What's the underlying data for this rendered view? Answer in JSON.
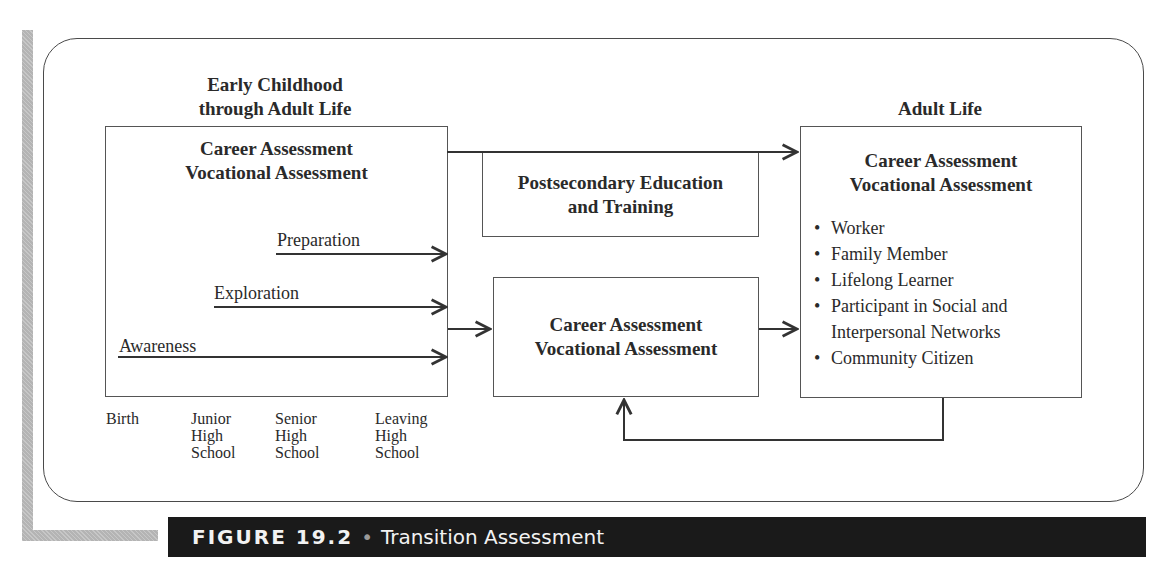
{
  "figure": {
    "number_label": "FIGURE 19.2",
    "separator": "•",
    "title": "Transition Assessment"
  },
  "left_column": {
    "heading_line1": "Early Childhood",
    "heading_line2": "through Adult Life",
    "box_title_line1": "Career Assessment",
    "box_title_line2": "Vocational Assessment",
    "stages": [
      {
        "label": "Preparation"
      },
      {
        "label": "Exploration"
      },
      {
        "label": "Awareness"
      }
    ],
    "timeline": [
      {
        "lines": [
          "Birth"
        ]
      },
      {
        "lines": [
          "Junior",
          "High",
          "School"
        ]
      },
      {
        "lines": [
          "Senior",
          "High",
          "School"
        ]
      },
      {
        "lines": [
          "Leaving",
          "High",
          "School"
        ]
      }
    ]
  },
  "postsecondary_box": {
    "line1": "Postsecondary Education",
    "line2": "and Training"
  },
  "middle_box": {
    "line1": "Career Assessment",
    "line2": "Vocational Assessment"
  },
  "right_column": {
    "heading": "Adult Life",
    "box_title_line1": "Career Assessment",
    "box_title_line2": "Vocational Assessment",
    "roles": [
      "Worker",
      "Family Member",
      "Lifelong Learner",
      "Participant in Social and Interpersonal Networks",
      "Community Citizen"
    ]
  },
  "colors": {
    "line": "#333333",
    "caption_bg": "#1a1a1a",
    "caption_text": "#f2f2f2",
    "accent_bar": "#b4b4b4"
  }
}
